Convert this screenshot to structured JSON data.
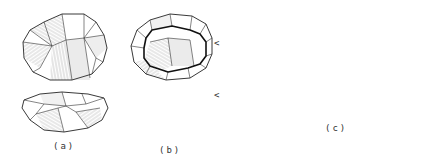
{
  "figure": {
    "panels": [
      {
        "id": "a",
        "label": "(a)",
        "views": [
          "top-view",
          "side-view"
        ]
      },
      {
        "id": "b",
        "label": "(b)",
        "views": [
          "top-view",
          "side-view"
        ],
        "markers": [
          "<",
          "<"
        ]
      },
      {
        "id": "c",
        "label": "(c)",
        "views": [
          "core-face",
          "flake-dorsal",
          "flake-profile",
          "flake-ventral"
        ]
      }
    ]
  },
  "colors": {
    "background": "#ffffff",
    "ink": "#222222"
  }
}
